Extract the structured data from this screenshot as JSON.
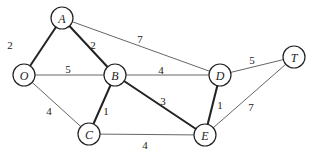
{
  "graph": {
    "nodes": [
      {
        "id": "A",
        "label": "A",
        "x": 62,
        "y": 18
      },
      {
        "id": "O",
        "label": "O",
        "x": 24,
        "y": 75
      },
      {
        "id": "B",
        "label": "B",
        "x": 115,
        "y": 75
      },
      {
        "id": "C",
        "label": "C",
        "x": 89,
        "y": 134
      },
      {
        "id": "D",
        "label": "D",
        "x": 220,
        "y": 75
      },
      {
        "id": "E",
        "label": "E",
        "x": 205,
        "y": 135
      },
      {
        "id": "T",
        "label": "T",
        "x": 294,
        "y": 57
      }
    ],
    "edges": [
      {
        "from": "O",
        "to": "A",
        "weight": "2",
        "bold": true,
        "lx": 10,
        "ly": 45
      },
      {
        "from": "A",
        "to": "B",
        "weight": "2",
        "bold": true,
        "lx": 93,
        "ly": 45
      },
      {
        "from": "A",
        "to": "D",
        "weight": "7",
        "bold": false,
        "lx": 140,
        "ly": 39
      },
      {
        "from": "O",
        "to": "B",
        "weight": "5",
        "bold": false,
        "lx": 68,
        "ly": 69
      },
      {
        "from": "B",
        "to": "D",
        "weight": "4",
        "bold": false,
        "lx": 161,
        "ly": 70
      },
      {
        "from": "D",
        "to": "T",
        "weight": "5",
        "bold": false,
        "lx": 252,
        "ly": 60
      },
      {
        "from": "O",
        "to": "C",
        "weight": "4",
        "bold": false,
        "lx": 49,
        "ly": 111
      },
      {
        "from": "B",
        "to": "C",
        "weight": "1",
        "bold": true,
        "lx": 106,
        "ly": 111
      },
      {
        "from": "B",
        "to": "E",
        "weight": "3",
        "bold": true,
        "lx": 163,
        "ly": 101
      },
      {
        "from": "D",
        "to": "E",
        "weight": "1",
        "bold": true,
        "lx": 220,
        "ly": 105
      },
      {
        "from": "C",
        "to": "E",
        "weight": "4",
        "bold": false,
        "lx": 145,
        "ly": 145
      },
      {
        "from": "E",
        "to": "T",
        "weight": "7",
        "bold": false,
        "lx": 251,
        "ly": 107
      }
    ],
    "node_radius": 11
  }
}
